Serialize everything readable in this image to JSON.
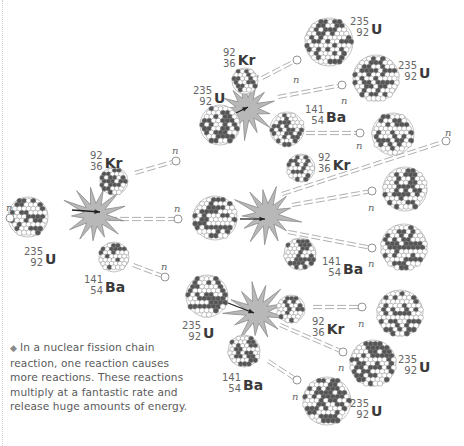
{
  "caption": {
    "bullet": "◆",
    "text": "In a nuclear fission chain reaction, one reaction causes more reactions. These reactions multiply at a fantastic rate and release huge amounts of energy."
  },
  "colors": {
    "starburst_fill": "#b8b8b8",
    "starburst_stroke": "#8c8c8c",
    "nucleon_dark": "#555555",
    "nucleon_light": "#ffffff",
    "nucleon_stroke": "#888888",
    "neutron_trail": "#9a9a9a",
    "text": "#444444"
  },
  "neutron_label": "n",
  "nuclei": [
    {
      "id": "u-initial",
      "element": "U",
      "mass": "235",
      "atomic": "92",
      "cx": 28,
      "cy": 217,
      "r": 20,
      "label_x": 24,
      "label_y": 246
    },
    {
      "id": "kr-gen1",
      "element": "Kr",
      "mass": "92",
      "atomic": "36",
      "cx": 114,
      "cy": 181,
      "r": 14,
      "label_x": 90,
      "label_y": 150
    },
    {
      "id": "ba-gen1",
      "element": "Ba",
      "mass": "141",
      "atomic": "54",
      "cx": 114,
      "cy": 257,
      "r": 15,
      "label_x": 84,
      "label_y": 274
    },
    {
      "id": "u-gen2-top",
      "element": "U",
      "mass": "235",
      "atomic": "92",
      "cx": 220,
      "cy": 125,
      "r": 20,
      "label_x": 193,
      "label_y": 85
    },
    {
      "id": "u-gen2-mid",
      "element": "U",
      "mass": "235",
      "atomic": "92",
      "cx": 215,
      "cy": 218,
      "r": 22,
      "label_x": null,
      "label_y": null
    },
    {
      "id": "u-gen2-bot",
      "element": "U",
      "mass": "235",
      "atomic": "92",
      "cx": 207,
      "cy": 296,
      "r": 21,
      "label_x": 182,
      "label_y": 320
    },
    {
      "id": "kr-top",
      "element": "Kr",
      "mass": "92",
      "atomic": "36",
      "cx": 245,
      "cy": 81,
      "r": 13,
      "label_x": 223,
      "label_y": 47
    },
    {
      "id": "ba-top",
      "element": "Ba",
      "mass": "141",
      "atomic": "54",
      "cx": 287,
      "cy": 129,
      "r": 17,
      "label_x": 305,
      "label_y": 104
    },
    {
      "id": "kr-mid",
      "element": "Kr",
      "mass": "92",
      "atomic": "36",
      "cx": 301,
      "cy": 168,
      "r": 14,
      "label_x": 318,
      "label_y": 152
    },
    {
      "id": "ba-mid",
      "element": "Ba",
      "mass": "141",
      "atomic": "54",
      "cx": 300,
      "cy": 254,
      "r": 16,
      "label_x": 322,
      "label_y": 256
    },
    {
      "id": "kr-bot",
      "element": "Kr",
      "mass": "92",
      "atomic": "36",
      "cx": 291,
      "cy": 309,
      "r": 14,
      "label_x": 312,
      "label_y": 316
    },
    {
      "id": "ba-bot",
      "element": "Ba",
      "mass": "141",
      "atomic": "54",
      "cx": 244,
      "cy": 351,
      "r": 16,
      "label_x": 222,
      "label_y": 372
    },
    {
      "id": "u-gen3-1",
      "element": "U",
      "mass": "235",
      "atomic": "92",
      "cx": 329,
      "cy": 42,
      "r": 24,
      "label_x": 350,
      "label_y": 16
    },
    {
      "id": "u-gen3-2",
      "element": "U",
      "mass": "235",
      "atomic": "92",
      "cx": 376,
      "cy": 78,
      "r": 23,
      "label_x": 398,
      "label_y": 60
    },
    {
      "id": "u-gen3-3",
      "element": "U",
      "mass": "235",
      "atomic": "92",
      "cx": 393,
      "cy": 134,
      "r": 21,
      "label_x": null,
      "label_y": null
    },
    {
      "id": "u-gen3-4",
      "element": "U",
      "mass": "235",
      "atomic": "92",
      "cx": 405,
      "cy": 189,
      "r": 22,
      "label_x": null,
      "label_y": null
    },
    {
      "id": "u-gen3-5",
      "element": "U",
      "mass": "235",
      "atomic": "92",
      "cx": 404,
      "cy": 247,
      "r": 23,
      "label_x": null,
      "label_y": null
    },
    {
      "id": "u-gen3-6",
      "element": "U",
      "mass": "235",
      "atomic": "92",
      "cx": 400,
      "cy": 313,
      "r": 23,
      "label_x": null,
      "label_y": null
    },
    {
      "id": "u-gen3-7",
      "element": "U",
      "mass": "235",
      "atomic": "92",
      "cx": 373,
      "cy": 363,
      "r": 23,
      "label_x": 398,
      "label_y": 354
    },
    {
      "id": "u-gen3-8",
      "element": "U",
      "mass": "235",
      "atomic": "92",
      "cx": 327,
      "cy": 401,
      "r": 24,
      "label_x": 350,
      "label_y": 398
    }
  ],
  "starbursts": [
    {
      "id": "burst-1",
      "cx": 95,
      "cy": 215,
      "r": 30,
      "arrow": {
        "x1": 72,
        "y1": 210,
        "x2": 100,
        "y2": 212
      }
    },
    {
      "id": "burst-top",
      "cx": 247,
      "cy": 109,
      "r": 30,
      "arrow": {
        "x1": 222,
        "y1": 120,
        "x2": 248,
        "y2": 107
      }
    },
    {
      "id": "burst-mid",
      "cx": 267,
      "cy": 215,
      "r": 30,
      "arrow": {
        "x1": 240,
        "y1": 219,
        "x2": 265,
        "y2": 219
      }
    },
    {
      "id": "burst-bot",
      "cx": 257,
      "cy": 312,
      "r": 30,
      "arrow": {
        "x1": 228,
        "y1": 303,
        "x2": 254,
        "y2": 313
      }
    }
  ],
  "neutrons": [
    {
      "id": "n-incoming",
      "x": 10,
      "y": 218,
      "lx": 6,
      "ly": 202,
      "trail": null
    },
    {
      "id": "n-g1-top",
      "x": 176,
      "y": 161,
      "lx": 172,
      "ly": 145,
      "trail": [
        135,
        173
      ]
    },
    {
      "id": "n-g1-mid",
      "x": 178,
      "y": 219,
      "lx": 174,
      "ly": 203,
      "trail": [
        108,
        219
      ]
    },
    {
      "id": "n-g1-bot",
      "x": 165,
      "y": 277,
      "lx": 161,
      "ly": 261,
      "trail": [
        133,
        265
      ]
    },
    {
      "id": "n-top-1",
      "x": 297,
      "y": 60,
      "lx": 293,
      "ly": 74,
      "trail": [
        262,
        78
      ]
    },
    {
      "id": "n-top-2",
      "x": 342,
      "y": 85,
      "lx": 341,
      "ly": 95,
      "trail": [
        278,
        97
      ]
    },
    {
      "id": "n-top-3",
      "x": 360,
      "y": 133,
      "lx": 356,
      "ly": 140,
      "trail": [
        306,
        133
      ]
    },
    {
      "id": "n-mid-1",
      "x": 446,
      "y": 141,
      "lx": 445,
      "ly": 127,
      "trail": [
        282,
        194
      ]
    },
    {
      "id": "n-mid-2",
      "x": 372,
      "y": 191,
      "lx": 368,
      "ly": 202,
      "trail": [
        292,
        205
      ]
    },
    {
      "id": "n-mid-3",
      "x": 372,
      "y": 248,
      "lx": 368,
      "ly": 258,
      "trail": [
        288,
        232
      ]
    },
    {
      "id": "n-bot-1",
      "x": 362,
      "y": 307,
      "lx": 358,
      "ly": 318,
      "trail": [
        313,
        307
      ]
    },
    {
      "id": "n-bot-2",
      "x": 343,
      "y": 352,
      "lx": 338,
      "ly": 362,
      "trail": [
        280,
        325
      ]
    },
    {
      "id": "n-bot-3",
      "x": 297,
      "y": 380,
      "lx": 292,
      "ly": 391,
      "trail": [
        268,
        361
      ]
    }
  ]
}
